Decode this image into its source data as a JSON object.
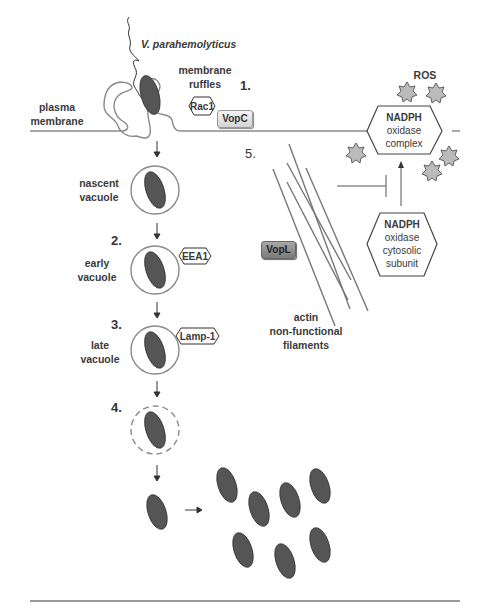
{
  "diagram": {
    "labels": {
      "bacterium": "V. parahemolyticus",
      "membrane_ruffles_1": "membrane",
      "membrane_ruffles_2": "ruffles",
      "plasma_membrane_1": "plasma",
      "plasma_membrane_2": "membrane",
      "nascent_vacuole_1": "nascent",
      "nascent_vacuole_2": "vacuole",
      "early_vacuole_1": "early",
      "early_vacuole_2": "vacuole",
      "late_vacuole_1": "late",
      "late_vacuole_2": "vacuole",
      "ros": "ROS",
      "actin_1": "actin",
      "actin_2": "non-functional",
      "actin_3": "filaments"
    },
    "steps": {
      "s1": "1.",
      "s2": "2.",
      "s3": "3.",
      "s4": "4.",
      "s5": "5."
    },
    "markers": {
      "rac1": "Rac1",
      "eea1": "EEA1",
      "lamp1": "Lamp-1"
    },
    "effectors": {
      "vopc": "VopC",
      "vopl": "VopL"
    },
    "nadph_complex": {
      "line1": "NADPH",
      "line2": "oxidase",
      "line3": "complex"
    },
    "nadph_subunit": {
      "line1": "NADPH",
      "line2": "oxidase",
      "line3": "cytosolic",
      "line4": "subunit"
    },
    "colors": {
      "line": "#888888",
      "bacterium": "#555555",
      "ros_fill": "#bbbbbb",
      "vopl_fill": "#8a8a8a",
      "vopc_fill": "#e4e4e4"
    }
  }
}
